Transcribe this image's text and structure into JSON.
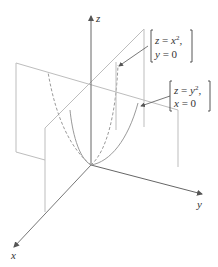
{
  "axes": {
    "x_label": "x",
    "y_label": "y",
    "z_label": "z"
  },
  "annotations": [
    {
      "line1_var": "z",
      "line1_eq": " = ",
      "line1_rhs": "x",
      "line1_exp": "2",
      "line1_tail": ",",
      "line2_var": "y",
      "line2_eq": " = 0"
    },
    {
      "line1_var": "z",
      "line1_eq": " = ",
      "line1_rhs": "y",
      "line1_exp": "2",
      "line1_tail": ",",
      "line2_var": "x",
      "line2_eq": " = 0"
    }
  ],
  "colors": {
    "plane": "#b5b5b5",
    "axis": "#6e6e6e",
    "curve": "#9a9a9a",
    "text": "#333333"
  }
}
